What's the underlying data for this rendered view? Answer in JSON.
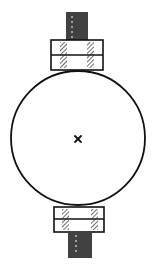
{
  "figure": {
    "type": "technical-line-drawing",
    "background": "#ffffff",
    "stroke": "#111111",
    "hatch": "#333333",
    "circle": {
      "cx": 78,
      "cy": 138,
      "r": 67
    },
    "center_mark": {
      "symbol": "x",
      "x": 78,
      "y": 139
    },
    "top_block": {
      "x": 51,
      "y": 40,
      "w": 52,
      "h": 30,
      "divider_y": 55
    },
    "top_bolt": {
      "x": 66,
      "y": 12,
      "w": 22,
      "h": 28
    },
    "bottom_block": {
      "x": 54,
      "y": 207,
      "w": 50,
      "h": 25,
      "divider_y": 219
    },
    "bottom_bolt": {
      "x": 68,
      "y": 232,
      "w": 24,
      "h": 26
    }
  }
}
